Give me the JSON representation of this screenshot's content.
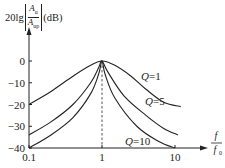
{
  "chart_data": {
    "type": "line",
    "title": "",
    "ylabel": "20lg|Au/Aup|(dB)",
    "ylabel_parts": {
      "prefix": "20lg",
      "num": "A",
      "num_sub": "u",
      "den": "A",
      "den_sub": "up",
      "unit": "(dB)"
    },
    "xlabel": "f/f0",
    "xlabel_parts": {
      "num": "f",
      "den": "f",
      "den_sub": "0"
    },
    "xscale": "log",
    "xlim": [
      0.1,
      10
    ],
    "ylim": [
      -40,
      0
    ],
    "x_ticks": [
      0.1,
      1,
      10
    ],
    "x_tick_labels": [
      "0.1",
      "1",
      "10"
    ],
    "y_ticks": [
      0,
      -10,
      -20,
      -30,
      -40
    ],
    "y_tick_labels": [
      "0",
      "−10",
      "−20",
      "−30",
      "−40"
    ],
    "grid": false,
    "annotations": [
      {
        "type": "vline",
        "x": 1,
        "style": "dashed"
      }
    ],
    "series": [
      {
        "name": "Q=1",
        "x": [
          0.1,
          0.2,
          0.4,
          0.7,
          1,
          1.5,
          2.5,
          4,
          7,
          12
        ],
        "y": [
          -20,
          -14,
          -7,
          -2,
          0,
          -2,
          -7,
          -13,
          -19,
          -21
        ]
      },
      {
        "name": "Q=5",
        "x": [
          0.1,
          0.2,
          0.4,
          0.7,
          0.9,
          1,
          1.2,
          2,
          4,
          7,
          11
        ],
        "y": [
          -34,
          -28,
          -20,
          -10,
          -3,
          0,
          -5,
          -16,
          -25,
          -31,
          -34
        ]
      },
      {
        "name": "Q=10",
        "x": [
          0.1,
          0.2,
          0.4,
          0.7,
          0.9,
          1,
          1.1,
          1.5,
          3,
          6,
          10
        ],
        "y": [
          -40,
          -34,
          -26,
          -15,
          -6,
          0,
          -6,
          -17,
          -30,
          -37,
          -40
        ]
      }
    ],
    "legend": "inline labels"
  }
}
